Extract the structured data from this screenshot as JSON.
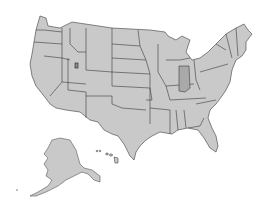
{
  "map": {
    "type": "locator-map",
    "region": "United States",
    "highlighted_state": "Indiana",
    "marker": {
      "state": "Utah",
      "label": ""
    },
    "colors": {
      "state_fill": "#c9c9c9",
      "highlight_fill": "#a9a9a9",
      "border": "#3a3a3a",
      "background": "#ffffff"
    },
    "insets": [
      "Alaska",
      "Hawaii"
    ]
  }
}
